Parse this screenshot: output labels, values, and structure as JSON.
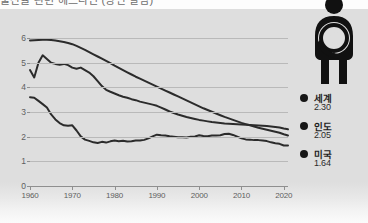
{
  "header": {
    "title_clipped": "출산율 관련 헤드라인 (상단 잘림)"
  },
  "icon": {
    "pictogram_name": "mother-holding-baby-icon"
  },
  "legend": {
    "position": "right",
    "items": [
      {
        "name": "세계",
        "value": "2.30",
        "color": "#161616",
        "dot_icon": "legend-dot-icon"
      },
      {
        "name": "인도",
        "value": "2.05",
        "color": "#161616",
        "dot_icon": "legend-dot-icon"
      },
      {
        "name": "미국",
        "value": "1.64",
        "color": "#161616",
        "dot_icon": "legend-dot-icon"
      }
    ]
  },
  "axes": {
    "y_ticks": [
      "6",
      "5",
      "4",
      "3",
      "2",
      "1",
      "0"
    ],
    "x_ticks": [
      "1960",
      "1970",
      "1980",
      "1990",
      "2000",
      "2010",
      "2020"
    ]
  },
  "colors": {
    "panel_background": "#dedede",
    "gridline": "#b9b9b9",
    "axis": "#8f8f8f",
    "line": "#2b2b2b",
    "tick_text": "#5e5e5e",
    "legend_text": "#1d1d1d"
  },
  "chart_data": {
    "type": "line",
    "title": "",
    "subtitle": "",
    "xlabel": "",
    "ylabel": "",
    "xlim": [
      1960,
      2021
    ],
    "ylim": [
      0,
      6
    ],
    "grid": true,
    "legend_position": "right",
    "x": [
      1960,
      1961,
      1962,
      1963,
      1964,
      1965,
      1966,
      1967,
      1968,
      1969,
      1970,
      1971,
      1972,
      1973,
      1974,
      1975,
      1976,
      1977,
      1978,
      1979,
      1980,
      1981,
      1982,
      1983,
      1984,
      1985,
      1986,
      1987,
      1988,
      1989,
      1990,
      1991,
      1992,
      1993,
      1994,
      1995,
      1996,
      1997,
      1998,
      1999,
      2000,
      2001,
      2002,
      2003,
      2004,
      2005,
      2006,
      2007,
      2008,
      2009,
      2010,
      2011,
      2012,
      2013,
      2014,
      2015,
      2016,
      2017,
      2018,
      2019,
      2020,
      2021
    ],
    "series": [
      {
        "name": "인도",
        "label_value": "2.05",
        "color": "#2b2b2b",
        "values": [
          5.9,
          5.91,
          5.92,
          5.93,
          5.93,
          5.92,
          5.9,
          5.87,
          5.84,
          5.8,
          5.75,
          5.68,
          5.6,
          5.52,
          5.43,
          5.34,
          5.25,
          5.16,
          5.07,
          4.98,
          4.88,
          4.79,
          4.7,
          4.61,
          4.52,
          4.43,
          4.35,
          4.27,
          4.19,
          4.11,
          4.03,
          3.95,
          3.87,
          3.79,
          3.71,
          3.63,
          3.55,
          3.47,
          3.39,
          3.31,
          3.23,
          3.15,
          3.08,
          3.01,
          2.94,
          2.87,
          2.8,
          2.74,
          2.68,
          2.62,
          2.56,
          2.51,
          2.46,
          2.41,
          2.36,
          2.32,
          2.28,
          2.24,
          2.2,
          2.16,
          2.1,
          2.05
        ]
      },
      {
        "name": "세계",
        "label_value": "2.30",
        "color": "#2b2b2b",
        "values": [
          4.7,
          4.4,
          5.0,
          5.3,
          5.15,
          5.0,
          4.95,
          4.92,
          4.95,
          4.9,
          4.8,
          4.75,
          4.8,
          4.7,
          4.6,
          4.45,
          4.25,
          4.05,
          3.9,
          3.82,
          3.75,
          3.68,
          3.62,
          3.58,
          3.52,
          3.48,
          3.42,
          3.38,
          3.34,
          3.3,
          3.25,
          3.18,
          3.1,
          3.02,
          2.96,
          2.9,
          2.85,
          2.8,
          2.76,
          2.72,
          2.68,
          2.65,
          2.62,
          2.59,
          2.57,
          2.55,
          2.53,
          2.52,
          2.51,
          2.5,
          2.49,
          2.48,
          2.47,
          2.46,
          2.45,
          2.44,
          2.43,
          2.41,
          2.39,
          2.37,
          2.33,
          2.3
        ]
      },
      {
        "name": "미국",
        "label_value": "1.64",
        "color": "#2b2b2b",
        "values": [
          3.6,
          3.58,
          3.45,
          3.32,
          3.18,
          2.9,
          2.7,
          2.55,
          2.46,
          2.44,
          2.46,
          2.25,
          2.01,
          1.88,
          1.83,
          1.77,
          1.74,
          1.79,
          1.76,
          1.81,
          1.84,
          1.81,
          1.83,
          1.8,
          1.81,
          1.84,
          1.84,
          1.87,
          1.93,
          2.01,
          2.08,
          2.06,
          2.05,
          2.02,
          2.0,
          1.98,
          1.98,
          1.97,
          2.0,
          2.01,
          2.06,
          2.03,
          2.02,
          2.05,
          2.05,
          2.06,
          2.11,
          2.12,
          2.07,
          2.0,
          1.93,
          1.89,
          1.88,
          1.86,
          1.86,
          1.84,
          1.82,
          1.77,
          1.73,
          1.71,
          1.64,
          1.64
        ]
      }
    ]
  }
}
